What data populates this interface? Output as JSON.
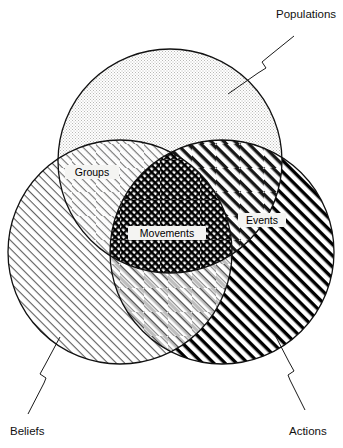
{
  "diagram": {
    "type": "venn-3-circle",
    "title": "",
    "background_color": "#ffffff",
    "outline_color": "#111111",
    "sets": [
      {
        "id": "populations",
        "label": "Populations",
        "label_position": "top-right-external",
        "fill_pattern": "stipple-dots",
        "fill_color": "#e8e8e6",
        "cx": 170,
        "cy": 161,
        "r": 112
      },
      {
        "id": "beliefs",
        "label": "Beliefs",
        "label_position": "bottom-left-external",
        "fill_pattern": "thin-diagonal-hatch",
        "fill_color": "#777777",
        "cx": 120,
        "cy": 252,
        "r": 112
      },
      {
        "id": "actions",
        "label": "Actions",
        "label_position": "bottom-right-external",
        "fill_pattern": "thick-diagonal-hatch",
        "fill_color": "#000000",
        "cx": 222,
        "cy": 252,
        "r": 112
      }
    ],
    "intersections": [
      {
        "id": "groups",
        "label": "Groups",
        "of": [
          "populations",
          "beliefs"
        ],
        "label_x": 93,
        "label_y": 175
      },
      {
        "id": "events",
        "label": "Events",
        "of": [
          "populations",
          "actions"
        ],
        "label_x": 263,
        "label_y": 224
      },
      {
        "id": "movements",
        "label": "Movements",
        "of": [
          "populations",
          "beliefs",
          "actions"
        ],
        "label_x": 166,
        "label_y": 237
      }
    ],
    "leader_lines": [
      {
        "for": "populations",
        "description": "zigzag leader from Populations label down-left into top circle",
        "path": "M 294 36 L 268 57 L 262 62 L 266 68 L 258 73 L 228 94"
      },
      {
        "for": "beliefs",
        "description": "zigzag leader from Beliefs label up-right into left circle",
        "path": "M 28 414 L 44 383 L 46 378 L 40 374 L 45 365 L 60 337"
      },
      {
        "for": "actions",
        "description": "zigzag leader from Actions label up-left into right circle",
        "path": "M 305 410 L 290 380 L 288 375 L 294 371 L 289 362 L 275 335"
      }
    ],
    "external_labels": [
      {
        "id": "populations-label",
        "text": "Populations",
        "x": 276,
        "y": 18,
        "anchor": "start"
      },
      {
        "id": "beliefs-label",
        "text": "Beliefs",
        "x": 10,
        "y": 435,
        "anchor": "start"
      },
      {
        "id": "actions-label",
        "text": "Actions",
        "x": 290,
        "y": 435,
        "anchor": "start"
      }
    ]
  }
}
